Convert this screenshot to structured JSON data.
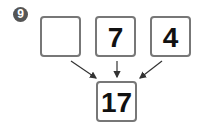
{
  "problem_number": "9",
  "boxes": {
    "top": [
      "",
      "7",
      "4"
    ],
    "bottom": "17"
  },
  "colors": {
    "border": "#777777",
    "badge": "#555555",
    "arrow": "#333333"
  }
}
